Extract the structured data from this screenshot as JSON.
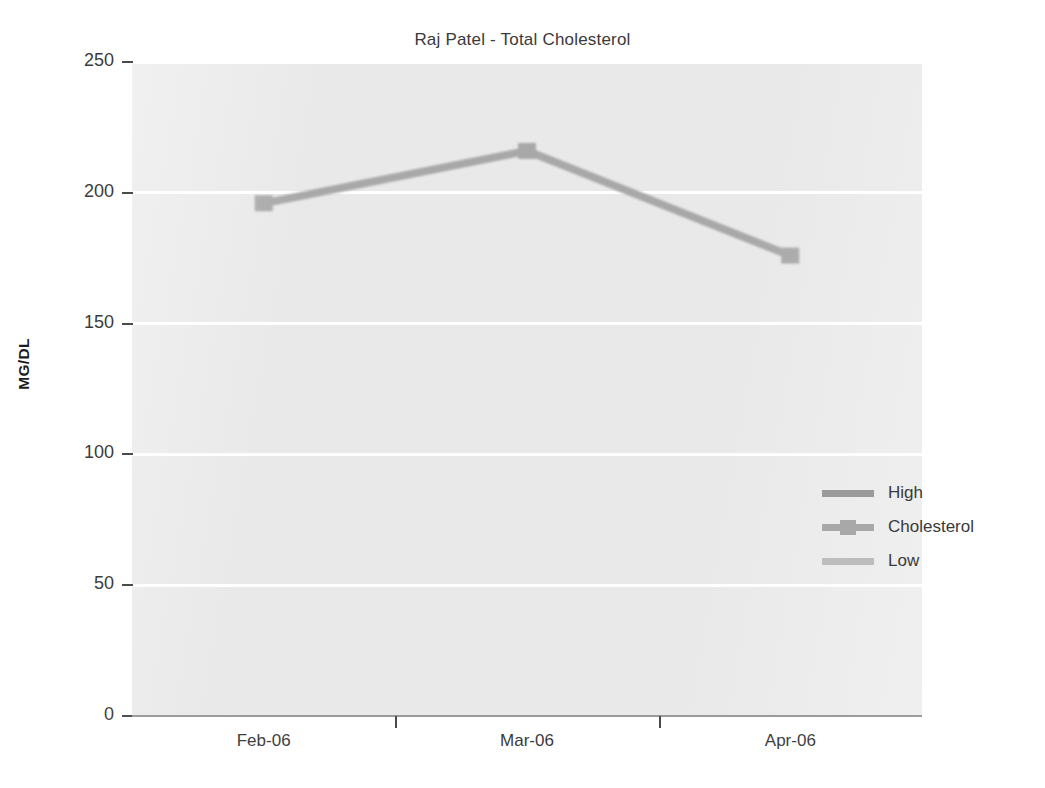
{
  "chart_data": {
    "type": "line",
    "title": "Raj Patel - Total Cholesterol",
    "xlabel": "",
    "ylabel": "MG/DL",
    "categories": [
      "Feb-06",
      "Mar-06",
      "Apr-06"
    ],
    "ylim": [
      0,
      250
    ],
    "yticks": [
      0,
      50,
      100,
      150,
      200,
      250
    ],
    "ytick_labels": [
      "0",
      "50",
      "100",
      "150",
      "200",
      "250"
    ],
    "grid": "horizontal",
    "legend_position": "inside-right",
    "series": [
      {
        "name": "High",
        "values": [
          200,
          200,
          200
        ],
        "color": "#9a9a9a",
        "marker": "none"
      },
      {
        "name": "Cholesterol",
        "values": [
          196,
          216,
          176
        ],
        "color": "#a8a8a8",
        "marker": "square"
      },
      {
        "name": "Low",
        "values": [
          140,
          140,
          140
        ],
        "color": "#bdbdbd",
        "marker": "none"
      }
    ]
  },
  "legend": {
    "items": [
      {
        "label": "High"
      },
      {
        "label": "Cholesterol"
      },
      {
        "label": "Low"
      }
    ]
  },
  "colors": {
    "plot_background": "#e9e9e9",
    "gridline": "#ffffff",
    "axis": "#4a4a4a",
    "text": "#3a3a3a",
    "high_series": "#9a9a9a",
    "cholesterol_series": "#a8a8a8",
    "low_series": "#bdbdbd"
  }
}
